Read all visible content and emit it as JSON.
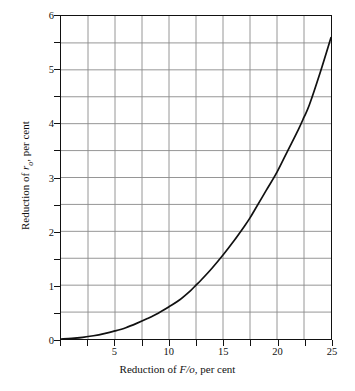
{
  "figure": {
    "background": "#ffffff",
    "axis_color": "#111111",
    "grid_color": "#8a8a8a",
    "curve_color": "#111111"
  },
  "axis_titles": {
    "x_prefix": "Reduction of ",
    "x_italic": "F/o",
    "x_suffix": ", per cent",
    "y_prefix": "Reduction of ",
    "y_italic": "r",
    "y_subscript": "o",
    "y_suffix": ", per cent"
  },
  "ticks": {
    "x_major_labels": [
      "5",
      "10",
      "15",
      "20",
      "25"
    ],
    "x_major_values": [
      5,
      10,
      15,
      20,
      25
    ],
    "x_gridline_values": [
      0,
      2.5,
      5,
      7.5,
      10,
      12.5,
      15,
      17.5,
      20,
      22.5,
      25
    ],
    "y_major_labels": [
      "0",
      "1",
      "2",
      "3",
      "4",
      "5",
      "6"
    ],
    "y_major_values": [
      0,
      1,
      2,
      3,
      4,
      5,
      6
    ],
    "y_gridline_values": [
      0,
      0.5,
      1,
      1.5,
      2,
      2.5,
      3,
      3.5,
      4,
      4.5,
      5,
      5.5,
      6
    ]
  },
  "chart_data": {
    "type": "line",
    "title": "",
    "xlabel": "Reduction of F/o, per cent",
    "ylabel": "Reduction of r_o, per cent",
    "xlim": [
      0,
      25
    ],
    "ylim": [
      0,
      6
    ],
    "grid": true,
    "legend": "none",
    "x_major_step": 5,
    "x_grid_step": 2.5,
    "y_major_step": 1,
    "y_grid_step": 0.5,
    "series": [
      {
        "name": "Reduction of r_o vs reduction of F/o",
        "x": [
          0,
          1,
          2,
          3,
          4,
          5,
          6,
          7,
          8,
          9,
          10,
          11,
          12,
          12.5,
          13,
          14,
          15,
          16,
          17,
          17.5,
          18,
          19,
          20,
          21,
          22,
          22.5,
          23,
          24,
          25
        ],
        "y": [
          0,
          0.01,
          0.03,
          0.06,
          0.1,
          0.15,
          0.21,
          0.29,
          0.38,
          0.48,
          0.6,
          0.73,
          0.9,
          1.0,
          1.1,
          1.32,
          1.56,
          1.82,
          2.1,
          2.25,
          2.42,
          2.76,
          3.1,
          3.5,
          3.9,
          4.12,
          4.35,
          4.95,
          5.6
        ]
      }
    ]
  }
}
